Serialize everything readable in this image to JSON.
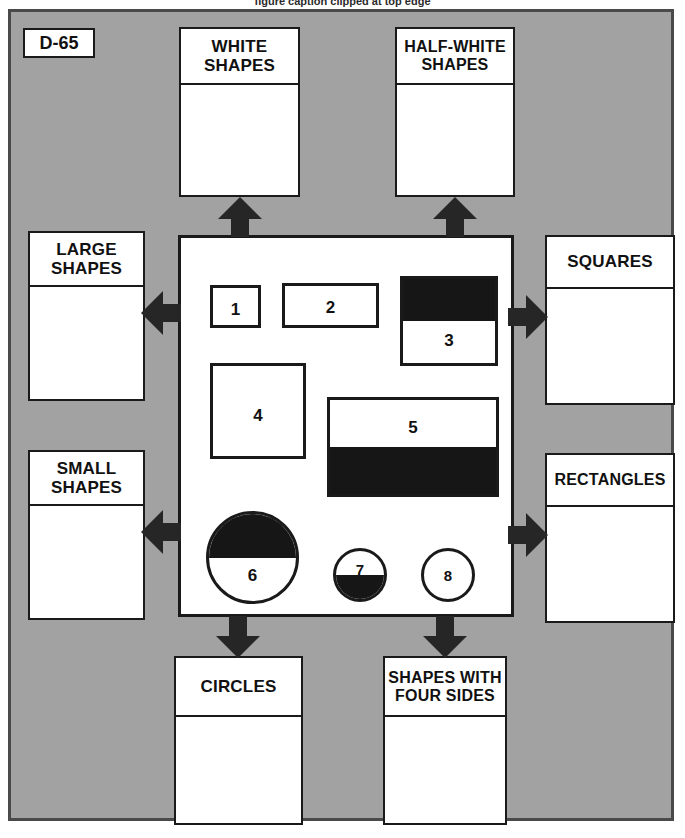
{
  "page": {
    "identifier": "D-65",
    "background_color": "#a2a2a2",
    "frame_border_color": "#4a4a4a",
    "ink_color": "#161616",
    "paper_color": "#ffffff",
    "caption_sliver": "figure caption clipped at top edge"
  },
  "categories": {
    "white_shapes": {
      "label": "WHITE SHAPES",
      "contents": ""
    },
    "half_white_shapes": {
      "label": "HALF-WHITE SHAPES",
      "contents": ""
    },
    "large_shapes": {
      "label": "LARGE SHAPES",
      "contents": ""
    },
    "small_shapes": {
      "label": "SMALL SHAPES",
      "contents": ""
    },
    "squares": {
      "label": "SQUARES",
      "contents": ""
    },
    "rectangles": {
      "label": "RECTANGLES",
      "contents": ""
    },
    "circles": {
      "label": "CIRCLES",
      "contents": ""
    },
    "four_sides": {
      "label": "SHAPES WITH FOUR SIDES",
      "contents": ""
    }
  },
  "shapes": [
    {
      "number": "1",
      "form": "square",
      "size": "small",
      "fill": "white"
    },
    {
      "number": "2",
      "form": "rectangle",
      "size": "small",
      "fill": "white"
    },
    {
      "number": "3",
      "form": "square",
      "size": "large",
      "fill": "half-white",
      "shaded_half": "top"
    },
    {
      "number": "4",
      "form": "square",
      "size": "large",
      "fill": "white"
    },
    {
      "number": "5",
      "form": "rectangle",
      "size": "large",
      "fill": "half-white",
      "shaded_half": "bottom"
    },
    {
      "number": "6",
      "form": "circle",
      "size": "large",
      "fill": "half-white",
      "shaded_half": "top"
    },
    {
      "number": "7",
      "form": "circle",
      "size": "small",
      "fill": "half-white",
      "shaded_half": "bottom"
    },
    {
      "number": "8",
      "form": "circle",
      "size": "small",
      "fill": "white"
    }
  ]
}
